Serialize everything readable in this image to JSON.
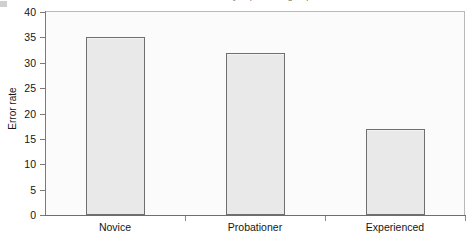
{
  "title": {
    "text": "Mean error rate by experience group",
    "clipped": true
  },
  "axes": {
    "y_title": "Error rate",
    "y_ticks": [
      "40",
      "35",
      "30",
      "25",
      "20",
      "15",
      "10",
      "5",
      "0"
    ],
    "x_categories": [
      "Novice",
      "Probationer",
      "Experienced"
    ]
  },
  "colors": {
    "bar_fill": "#e9e9e9",
    "bar_border": "#6f6f6f",
    "axis": "#7a7a7a",
    "plot_background": "#fbfbfb",
    "plot_border": "#b9b9b9",
    "text": "#151515"
  },
  "chart_data": {
    "type": "bar",
    "title": "Mean error rate by experience group",
    "xlabel": "",
    "ylabel": "Error rate",
    "categories": [
      "Novice",
      "Probationer",
      "Experienced"
    ],
    "values": [
      35,
      32,
      17
    ],
    "ylim": [
      0,
      40
    ],
    "ytick_step": 5,
    "yticks": [
      0,
      5,
      10,
      15,
      20,
      25,
      30,
      35,
      40
    ],
    "grid": false,
    "legend": false,
    "orientation": "vertical"
  }
}
